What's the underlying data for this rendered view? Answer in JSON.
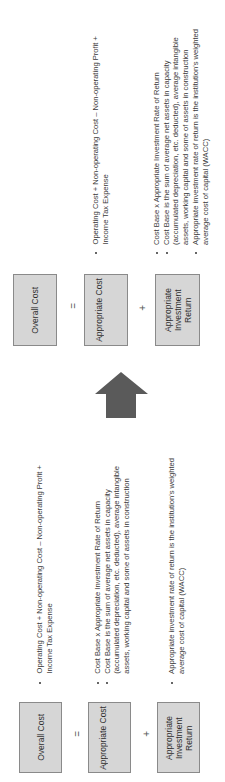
{
  "groups": {
    "top": {
      "overall_cost": "Overall Cost",
      "equals": "=",
      "appropriate_cost": "Appropriate Cost",
      "plus": "+",
      "appropriate_return": "Appropriate Investment Return",
      "operating_text": "Operating Cost + Non-operating Cost – Non-operating Profit +\nIncome Tax Expense",
      "cost_base_text": "Cost Base x Appropriate Investment Rate of Return\nCost Base is the sum of average net assets in capacity\n(accumulated depreciation, etc. deducted), average intangible\nassets, working capital and some of assets in construction\nAppropriate investment rate of return is the institution's weighted\naverage cost of capital (WACC)"
    },
    "bottom": {
      "overall_cost": "Overall Cost",
      "equals": "=",
      "appropriate_cost": "Appropriate Cost",
      "plus": "+",
      "appropriate_return": "Appropriate Investment Return",
      "operating_text": "Operating Cost + Non-operating Cost – Non-operating Profit +\nIncome Tax Expense",
      "cost_base_text": "Cost Base x Appropriate Investment Rate of Return\nCost Base is the sum of average net assets in capacity\n(accumulated depreciation, etc. deducted), average intangible\nassets, working capital and some of assets in construction",
      "wacc_text": "Appropriate investment rate of return is the institution's weighted\naverage cost of capital (WACC)"
    }
  },
  "arrow": {
    "icon": "arrow-up-icon",
    "color": "#5a5a5a"
  }
}
